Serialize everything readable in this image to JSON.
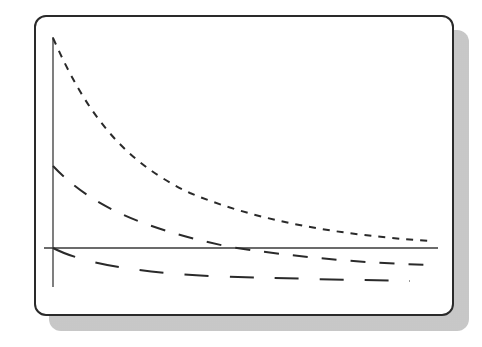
{
  "diagram": {
    "type": "decay-curves-sketch",
    "frame": {
      "style": "rounded rectangle with drop shadow"
    },
    "axes": {
      "x_axis": "horizontal baseline",
      "y_axis": "vertical axis",
      "labels": []
    },
    "curves": [
      {
        "name": "short-dash-curve",
        "style": "short dashes",
        "start": "high on y-axis",
        "trend": "exponential decay toward baseline, stays above"
      },
      {
        "name": "medium-dash-curve",
        "style": "medium dashes",
        "start": "mid on y-axis",
        "trend": "decays and crosses below baseline"
      },
      {
        "name": "long-dash-curve",
        "style": "long dashes",
        "start": "at origin",
        "trend": "decreases below baseline and levels off"
      }
    ],
    "colors": {
      "line": "#2a2a2a",
      "shadow": "#c8c8c8",
      "background": "#ffffff"
    }
  }
}
